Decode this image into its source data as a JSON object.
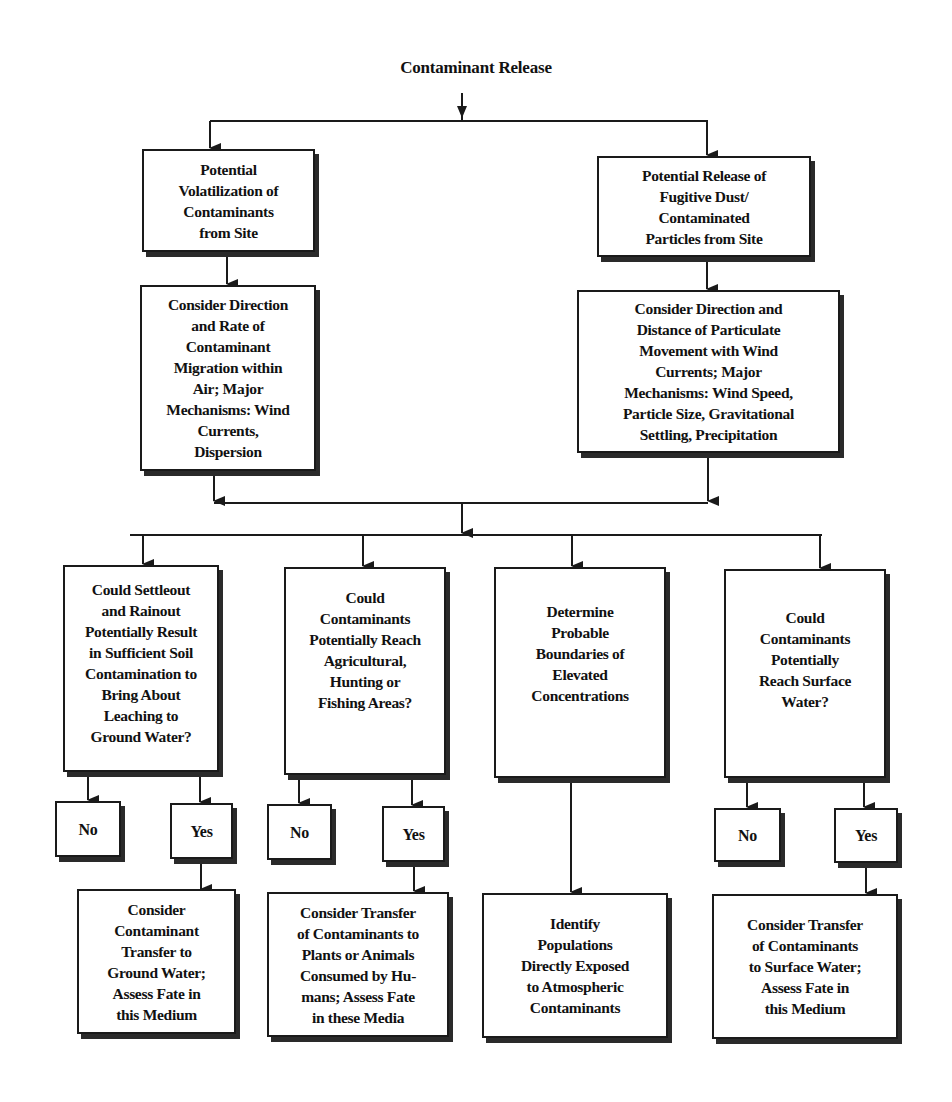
{
  "diagram": {
    "title": "Contaminant Release",
    "level1": {
      "left": "Potential\nVolatilization of\nContaminants\nfrom Site",
      "right": "Potential Release of\nFugitive Dust/\nContaminated\nParticles from Site"
    },
    "level2": {
      "left": "Consider Direction\nand Rate of\nContaminant\nMigration within\nAir;  Major\nMechanisms: Wind\nCurrents,\nDispersion",
      "right": "Consider Direction and\nDistance of Particulate\nMovement with Wind\nCurrents;  Major\nMechanisms: Wind Speed,\nParticle Size, Gravitational\nSettling, Precipitation"
    },
    "level3": [
      {
        "question": "Could Settleout\nand Rainout\nPotentially Result\nin Sufficient Soil\nContamination to\nBring About\nLeaching to\nGround Water?",
        "no": "No",
        "yes": "Yes",
        "outcome": "Consider\nContaminant\nTransfer to\nGround Water;\nAssess Fate in\nthis Medium"
      },
      {
        "question": "Could\nContaminants\nPotentially Reach\nAgricultural,\nHunting or\nFishing Areas?",
        "no": "No",
        "yes": "Yes",
        "outcome": "Consider Transfer\nof Contaminants to\nPlants or Animals\nConsumed by Hu-\nmans; Assess Fate\nin these Media"
      },
      {
        "question": "Determine\nProbable\nBoundaries of\nElevated\nConcentrations",
        "outcome": "Identify\nPopulations\nDirectly Exposed\nto Atmospheric\nContaminants"
      },
      {
        "question": "Could\nContaminants\nPotentially\nReach Surface\nWater?",
        "no": "No",
        "yes": "Yes",
        "outcome": "Consider Transfer\nof Contaminants\nto Surface Water;\nAssess Fate in\nthis Medium"
      }
    ]
  },
  "colors": {
    "line": "#1a1a1a",
    "shadow": "#2a2a2a",
    "background": "#ffffff"
  }
}
